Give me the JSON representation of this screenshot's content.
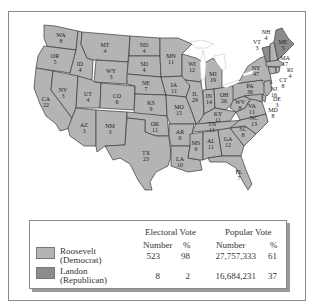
{
  "colors": {
    "democrat": "#b4b4b4",
    "republican": "#8c8c8c",
    "border": "#3a3a3a",
    "frame": "#8a8a8a",
    "lakes": "#ffffff"
  },
  "map": {
    "states": [
      {
        "abbr": "WA",
        "ev": "8",
        "party": "democrat"
      },
      {
        "abbr": "OR",
        "ev": "5",
        "party": "democrat"
      },
      {
        "abbr": "CA",
        "ev": "22",
        "party": "democrat"
      },
      {
        "abbr": "ID",
        "ev": "4",
        "party": "democrat"
      },
      {
        "abbr": "NV",
        "ev": "3",
        "party": "democrat"
      },
      {
        "abbr": "MT",
        "ev": "4",
        "party": "democrat"
      },
      {
        "abbr": "WY",
        "ev": "3",
        "party": "democrat"
      },
      {
        "abbr": "UT",
        "ev": "4",
        "party": "democrat"
      },
      {
        "abbr": "AZ",
        "ev": "3",
        "party": "democrat"
      },
      {
        "abbr": "CO",
        "ev": "6",
        "party": "democrat"
      },
      {
        "abbr": "NM",
        "ev": "3",
        "party": "democrat"
      },
      {
        "abbr": "ND",
        "ev": "4",
        "party": "democrat"
      },
      {
        "abbr": "SD",
        "ev": "4",
        "party": "democrat"
      },
      {
        "abbr": "NE",
        "ev": "7",
        "party": "democrat"
      },
      {
        "abbr": "KS",
        "ev": "9",
        "party": "democrat"
      },
      {
        "abbr": "OK",
        "ev": "11",
        "party": "democrat"
      },
      {
        "abbr": "TX",
        "ev": "23",
        "party": "democrat"
      },
      {
        "abbr": "MN",
        "ev": "11",
        "party": "democrat"
      },
      {
        "abbr": "IA",
        "ev": "11",
        "party": "democrat"
      },
      {
        "abbr": "MO",
        "ev": "15",
        "party": "democrat"
      },
      {
        "abbr": "AR",
        "ev": "9",
        "party": "democrat"
      },
      {
        "abbr": "LA",
        "ev": "10",
        "party": "democrat"
      },
      {
        "abbr": "WI",
        "ev": "12",
        "party": "democrat"
      },
      {
        "abbr": "IL",
        "ev": "29",
        "party": "democrat"
      },
      {
        "abbr": "MI",
        "ev": "19",
        "party": "democrat"
      },
      {
        "abbr": "IN",
        "ev": "14",
        "party": "democrat"
      },
      {
        "abbr": "OH",
        "ev": "26",
        "party": "democrat"
      },
      {
        "abbr": "KY",
        "ev": "11",
        "party": "democrat"
      },
      {
        "abbr": "TN",
        "ev": "11",
        "party": "democrat"
      },
      {
        "abbr": "MS",
        "ev": "9",
        "party": "democrat"
      },
      {
        "abbr": "AL",
        "ev": "11",
        "party": "democrat"
      },
      {
        "abbr": "GA",
        "ev": "12",
        "party": "democrat"
      },
      {
        "abbr": "FL",
        "ev": "7",
        "party": "democrat"
      },
      {
        "abbr": "SC",
        "ev": "8",
        "party": "democrat"
      },
      {
        "abbr": "NC",
        "ev": "13",
        "party": "democrat"
      },
      {
        "abbr": "VA",
        "ev": "11",
        "party": "democrat"
      },
      {
        "abbr": "WV",
        "ev": "8",
        "party": "democrat"
      },
      {
        "abbr": "PA",
        "ev": "36",
        "party": "democrat"
      },
      {
        "abbr": "NY",
        "ev": "47",
        "party": "democrat"
      },
      {
        "abbr": "VT",
        "ev": "3",
        "party": "republican"
      },
      {
        "abbr": "NH",
        "ev": "4",
        "party": "democrat"
      },
      {
        "abbr": "ME",
        "ev": "5",
        "party": "republican"
      },
      {
        "abbr": "MA",
        "ev": "17",
        "party": "democrat"
      },
      {
        "abbr": "RI",
        "ev": "4",
        "party": "democrat"
      },
      {
        "abbr": "CT",
        "ev": "8",
        "party": "democrat"
      },
      {
        "abbr": "NJ",
        "ev": "16",
        "party": "democrat"
      },
      {
        "abbr": "DE",
        "ev": "3",
        "party": "democrat"
      },
      {
        "abbr": "MD",
        "ev": "8",
        "party": "democrat"
      }
    ]
  },
  "legend": {
    "electoral_header": "Electoral Vote",
    "popular_header": "Popular Vote",
    "number_label": "Number",
    "percent_label": "%",
    "rows": [
      {
        "candidate": "Roosevelt",
        "party": "(Democrat)",
        "ev_number": "523",
        "ev_percent": "98",
        "pv_number": "27,757,333",
        "pv_percent": "61"
      },
      {
        "candidate": "Landon",
        "party": "(Republican)",
        "ev_number": "8",
        "ev_percent": "2",
        "pv_number": "16,684,231",
        "pv_percent": "37"
      }
    ]
  }
}
